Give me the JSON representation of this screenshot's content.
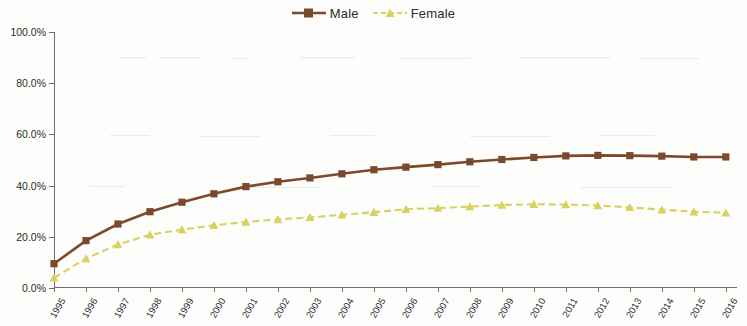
{
  "chart_data": {
    "type": "line",
    "title": "",
    "subtitle": "",
    "xlabel": "",
    "ylabel": "",
    "categories": [
      "1995",
      "1996",
      "1997",
      "1998",
      "1999",
      "2000",
      "2001",
      "2002",
      "2003",
      "2004",
      "2005",
      "2006",
      "2007",
      "2008",
      "2009",
      "2010",
      "2011",
      "2012",
      "2013",
      "2014",
      "2015",
      "2016"
    ],
    "ytick_labels": [
      "0.0%",
      "20.0%",
      "40.0%",
      "60.0%",
      "80.0%",
      "100.0%"
    ],
    "ytick_values": [
      0,
      20,
      40,
      60,
      80,
      100
    ],
    "ylim": [
      0,
      100
    ],
    "grid": false,
    "legend_position": "top-center",
    "series": [
      {
        "name": "Male",
        "color": "#7B4A2D",
        "line_style": "solid",
        "marker": "square",
        "values": [
          9.5,
          18.5,
          25.0,
          29.8,
          33.5,
          36.8,
          39.6,
          41.5,
          43.0,
          44.6,
          46.2,
          47.2,
          48.2,
          49.3,
          50.2,
          51.0,
          51.6,
          51.8,
          51.7,
          51.5,
          51.2,
          51.2
        ]
      },
      {
        "name": "Female",
        "color": "#D8D060",
        "line_style": "dashed",
        "marker": "triangle",
        "values": [
          4.0,
          11.5,
          17.0,
          20.8,
          22.8,
          24.5,
          25.8,
          26.8,
          27.6,
          28.6,
          29.6,
          30.8,
          31.2,
          31.8,
          32.4,
          32.7,
          32.6,
          32.2,
          31.5,
          30.6,
          29.8,
          29.4
        ]
      }
    ]
  },
  "legend": {
    "items": [
      {
        "label": "Male"
      },
      {
        "label": "Female"
      }
    ]
  },
  "colors": {
    "male": "#7B4A2D",
    "female": "#D8D060",
    "axis": "#6d6d6d",
    "text": "#2b2b2b",
    "background": "#fdfdfb"
  }
}
